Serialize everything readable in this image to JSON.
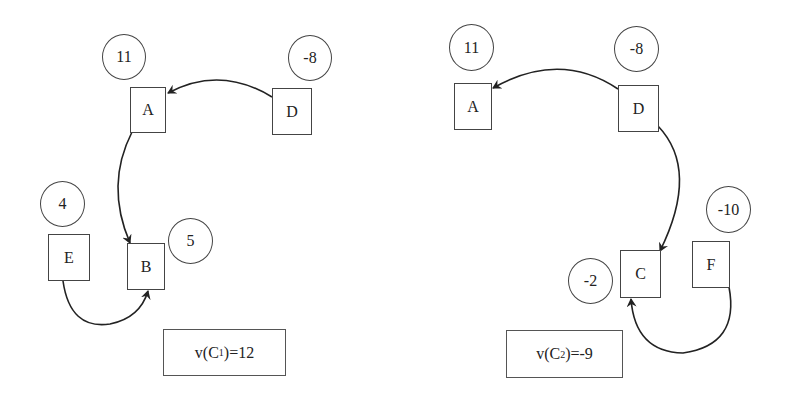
{
  "diagrams": [
    {
      "id": "C1",
      "nodes": [
        {
          "label": "A",
          "weight": "11"
        },
        {
          "label": "D",
          "weight": "-8"
        },
        {
          "label": "E",
          "weight": "4"
        },
        {
          "label": "B",
          "weight": "5"
        }
      ],
      "edges": [
        {
          "from": "D",
          "to": "A"
        },
        {
          "from": "A",
          "to": "B"
        },
        {
          "from": "E",
          "to": "B"
        }
      ],
      "value": {
        "prefix": "v(C",
        "subscript": "1",
        "suffix": ")=12"
      }
    },
    {
      "id": "C2",
      "nodes": [
        {
          "label": "A",
          "weight": "11"
        },
        {
          "label": "D",
          "weight": "-8"
        },
        {
          "label": "F",
          "weight": "-10"
        },
        {
          "label": "C",
          "weight": "-2"
        }
      ],
      "edges": [
        {
          "from": "D",
          "to": "A"
        },
        {
          "from": "D",
          "to": "C"
        },
        {
          "from": "F",
          "to": "C"
        }
      ],
      "value": {
        "prefix": "v(C",
        "subscript": "2",
        "suffix": ")=-9"
      }
    }
  ],
  "colors": {
    "stroke": "#222222",
    "background": "#ffffff"
  }
}
